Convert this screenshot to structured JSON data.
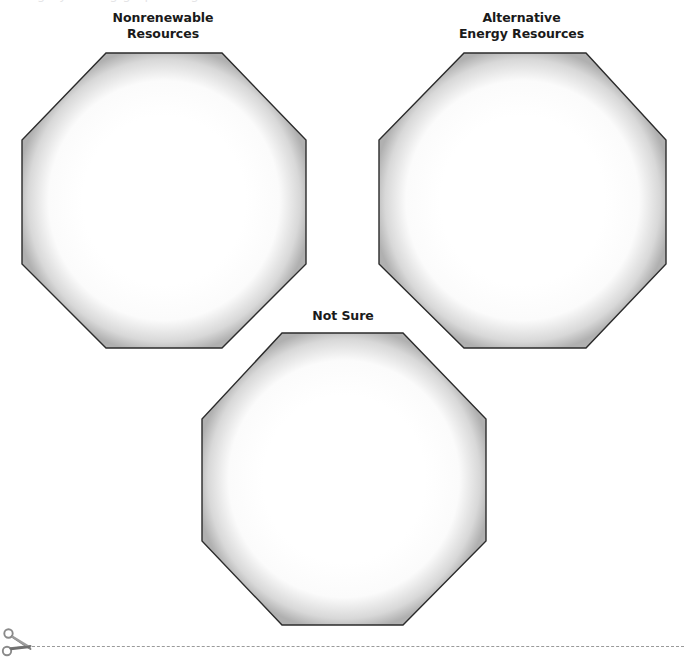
{
  "page": {
    "width": 684,
    "height": 663,
    "background": "#ffffff",
    "top_cutoff_artifact": "category sorting graphic organizer"
  },
  "worksheet": {
    "type": "sorting-graphic-organizer",
    "shape": "octagon",
    "category_count": 3,
    "categories": [
      {
        "id": "nonrenewable-resources",
        "title_lines": [
          "Nonrenewable",
          "Resources"
        ],
        "title": "Nonrenewable Resources",
        "x": 20,
        "y": 52,
        "width": 286,
        "height": 295,
        "title_y": 10
      },
      {
        "id": "alternative-energy-resources",
        "title_lines": [
          "Alternative",
          "Energy Resources"
        ],
        "title": "Alternative Energy Resources",
        "x": 377,
        "y": 52,
        "width": 289,
        "height": 295,
        "title_y": 10
      },
      {
        "id": "not-sure",
        "title_lines": [
          "Not Sure"
        ],
        "title": "Not Sure",
        "x": 200,
        "y": 334,
        "width": 286,
        "height": 292,
        "title_y": 308
      }
    ]
  },
  "cut_line": {
    "label": "cut-here-line",
    "icon": "scissors-icon",
    "y": 626,
    "dash_color": "#9a9a9a",
    "dash_style": "dashed"
  },
  "colors": {
    "outline": "#2b2b2b",
    "shadow_gray": "#b6b6b6",
    "fill": "#ffffff",
    "text": "#1a1a1a",
    "dash": "#9a9a9a",
    "scissors": "#8a8a8a"
  }
}
